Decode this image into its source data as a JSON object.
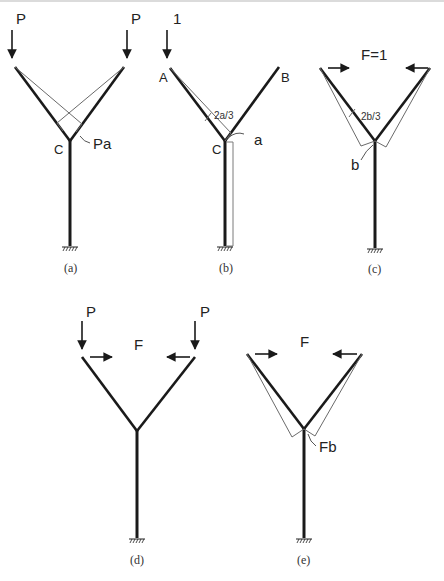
{
  "figure": {
    "panels": [
      {
        "id": "a",
        "caption": "(a)",
        "loads": [
          {
            "label": "P",
            "type": "vertical-down"
          },
          {
            "label": "P",
            "type": "vertical-down"
          }
        ],
        "labels": {
          "joint": "C",
          "moment": "Pa"
        }
      },
      {
        "id": "b",
        "caption": "(b)",
        "loads": [
          {
            "label": "1",
            "type": "vertical-down"
          }
        ],
        "labels": {
          "left_tip": "A",
          "right_tip": "B",
          "joint": "C",
          "arm_moment": "2a/3",
          "column_moment": "a"
        }
      },
      {
        "id": "c",
        "caption": "(c)",
        "loads": [
          {
            "label": "F=1",
            "type": "horizontal-pair-inward"
          }
        ],
        "labels": {
          "arm_moment": "2b/3",
          "column_moment": "b"
        }
      },
      {
        "id": "d",
        "caption": "(d)",
        "loads": [
          {
            "label": "P",
            "type": "vertical-down"
          },
          {
            "label": "P",
            "type": "vertical-down"
          },
          {
            "label": "F",
            "type": "horizontal-pair-inward"
          }
        ],
        "labels": {}
      },
      {
        "id": "e",
        "caption": "(e)",
        "loads": [
          {
            "label": "F",
            "type": "horizontal-pair-inward"
          }
        ],
        "labels": {
          "moment": "Fb"
        }
      }
    ]
  }
}
